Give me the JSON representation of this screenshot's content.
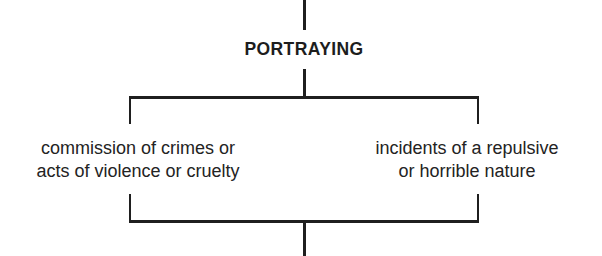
{
  "diagram": {
    "type": "bracket-tree",
    "orientation": "vertical",
    "background_color": "#ffffff",
    "line_color": "#1f1f1f",
    "text_color": "#232323",
    "root": {
      "label": "PORTRAYING",
      "emphasis": "bold-uppercase"
    },
    "branches": [
      {
        "id": "left",
        "lines": [
          "commission of crimes or",
          "acts of violence or cruelty"
        ]
      },
      {
        "id": "right",
        "lines": [
          "incidents of a repulsive",
          "or horrible nature"
        ]
      }
    ],
    "connectors": {
      "top_stem": "vertical-line-above-root",
      "root_stem": "vertical-line-below-root",
      "upper_bracket": "horizontal-split-bar",
      "lower_bracket": "horizontal-join-bar",
      "bottom_stem": "vertical-line-below-join"
    }
  }
}
